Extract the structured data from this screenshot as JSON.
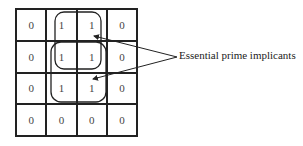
{
  "kmap": {
    "rows": [
      [
        "0",
        "1",
        "1",
        "0"
      ],
      [
        "0",
        "1",
        "1",
        "0"
      ],
      [
        "0",
        "1",
        "1",
        "0"
      ],
      [
        "0",
        "0",
        "0",
        "0"
      ]
    ]
  },
  "groups": [
    {
      "name": "top-group",
      "rows": [
        0,
        1
      ],
      "cols": [
        1,
        2
      ]
    },
    {
      "name": "bottom-group",
      "rows": [
        1,
        2
      ],
      "cols": [
        1,
        2
      ]
    }
  ],
  "annotation": {
    "label": "Essential prime implicants"
  }
}
